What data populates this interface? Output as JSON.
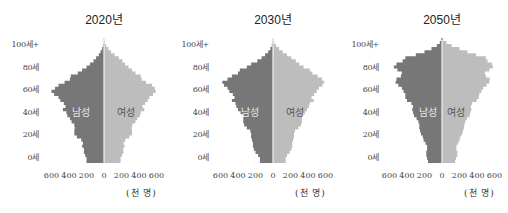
{
  "colors": {
    "male": "#777777",
    "female": "#bdbdbd",
    "axis_line": "#f2f2f2"
  },
  "unit_label": "(천 명)",
  "y_tick_labels": [
    "100세+",
    "80세",
    "60세",
    "40세",
    "20세",
    "0세"
  ],
  "x_tick_labels": [
    "600",
    "400",
    "200",
    "0",
    "200",
    "400",
    "600"
  ],
  "sex_labels": {
    "male": "남성",
    "female": "여성"
  },
  "chart_data": [
    {
      "type": "bar",
      "subtype": "population-pyramid",
      "title": "2020년",
      "xlabel": "(천 명)",
      "ylabel": "연령",
      "xlim": [
        -600,
        600
      ],
      "ylim": [
        0,
        100
      ],
      "age_step": 2.5,
      "age_groups_start": 0,
      "series": [
        {
          "name": "남성",
          "side": "left",
          "values": [
            200,
            200,
            215,
            230,
            230,
            250,
            240,
            260,
            310,
            340,
            340,
            335,
            340,
            370,
            390,
            420,
            430,
            470,
            440,
            460,
            500,
            520,
            570,
            600,
            560,
            520,
            450,
            390,
            380,
            300,
            250,
            200,
            160,
            120,
            90,
            60,
            40,
            22,
            10,
            5,
            2
          ]
        },
        {
          "name": "여성",
          "side": "right",
          "values": [
            190,
            190,
            205,
            220,
            220,
            235,
            225,
            245,
            290,
            320,
            320,
            315,
            325,
            360,
            380,
            410,
            420,
            460,
            440,
            470,
            500,
            520,
            560,
            590,
            580,
            550,
            480,
            430,
            420,
            360,
            320,
            280,
            240,
            210,
            170,
            120,
            80,
            50,
            25,
            12,
            4
          ]
        }
      ]
    },
    {
      "type": "bar",
      "subtype": "population-pyramid",
      "title": "2030년",
      "xlabel": "(천 명)",
      "ylabel": "연령",
      "xlim": [
        -600,
        600
      ],
      "ylim": [
        0,
        100
      ],
      "age_step": 2.5,
      "age_groups_start": 0,
      "series": [
        {
          "name": "남성",
          "side": "left",
          "values": [
            150,
            150,
            170,
            200,
            220,
            230,
            230,
            240,
            250,
            250,
            260,
            300,
            330,
            340,
            340,
            340,
            370,
            400,
            420,
            430,
            470,
            440,
            460,
            500,
            520,
            560,
            580,
            520,
            470,
            400,
            380,
            300,
            250,
            180,
            130,
            90,
            55,
            30,
            14,
            6,
            2
          ]
        },
        {
          "name": "여성",
          "side": "right",
          "values": [
            145,
            145,
            160,
            190,
            210,
            220,
            220,
            230,
            240,
            240,
            250,
            290,
            320,
            330,
            330,
            330,
            365,
            390,
            410,
            420,
            465,
            440,
            470,
            500,
            525,
            565,
            585,
            560,
            510,
            450,
            420,
            350,
            300,
            260,
            210,
            160,
            110,
            70,
            35,
            15,
            5
          ]
        }
      ]
    },
    {
      "type": "bar",
      "subtype": "population-pyramid",
      "title": "2050년",
      "xlabel": "(천 명)",
      "ylabel": "연령",
      "xlim": [
        -600,
        600
      ],
      "ylim": [
        0,
        100
      ],
      "age_step": 2.5,
      "age_groups_start": 0,
      "series": [
        {
          "name": "남성",
          "side": "left",
          "values": [
            160,
            170,
            180,
            180,
            170,
            170,
            190,
            210,
            220,
            240,
            250,
            260,
            260,
            270,
            290,
            320,
            330,
            340,
            330,
            350,
            400,
            420,
            420,
            440,
            460,
            500,
            530,
            520,
            470,
            460,
            510,
            550,
            520,
            450,
            420,
            300,
            200,
            120,
            60,
            25,
            8
          ]
        },
        {
          "name": "여성",
          "side": "right",
          "values": [
            150,
            160,
            175,
            175,
            165,
            165,
            185,
            200,
            210,
            230,
            240,
            250,
            255,
            265,
            285,
            315,
            325,
            335,
            330,
            345,
            395,
            420,
            425,
            450,
            470,
            510,
            540,
            545,
            500,
            490,
            540,
            580,
            570,
            520,
            500,
            390,
            290,
            200,
            110,
            50,
            15
          ]
        }
      ]
    }
  ]
}
